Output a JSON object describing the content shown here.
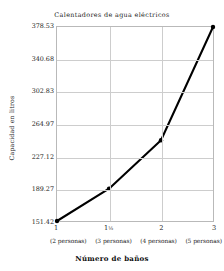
{
  "chart_data": {
    "type": "line",
    "title": "Calentadores de agua eléctricos",
    "xlabel": "Número de baños",
    "ylabel": "Capacidad en litros",
    "grid": true,
    "legend": "none",
    "x_categories": [
      "1",
      "1½",
      "2",
      "3"
    ],
    "x_tick_labels": [
      "1",
      "1½",
      "2",
      "3"
    ],
    "x_sub_labels": [
      "(2 personas)",
      "(3 personas)",
      "(4 personas)",
      "(5 personas)"
    ],
    "y_tick_labels": [
      "151.42",
      "189.27",
      "227.12",
      "264.97",
      "302.83",
      "340.68",
      "378.53"
    ],
    "y_tick_values": [
      151.42,
      189.27,
      227.12,
      264.97,
      302.83,
      340.68,
      378.53
    ],
    "ylim": [
      151.42,
      378.53
    ],
    "values": [
      151.42,
      189.27,
      246.0,
      378.53
    ],
    "series": [
      {
        "name": "Capacidad",
        "values": [
          151.42,
          189.27,
          246.0,
          378.53
        ],
        "color": "#000000",
        "marker": "circle",
        "line_width": 2.1
      }
    ]
  },
  "axis_colors": {
    "frame": "#b9b9b9",
    "grid": "#cdcdcd",
    "text": "#1a1a1a",
    "series": "#000000"
  }
}
